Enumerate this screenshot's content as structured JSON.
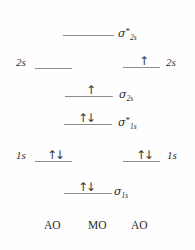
{
  "diagram": {
    "columns": [
      "AO",
      "MO",
      "AO"
    ],
    "footer": {
      "left": "AO",
      "center": "MO",
      "right": "AO"
    },
    "levels": [
      {
        "id": "sigma-star-2s",
        "column": "MO",
        "label": "σ*2s",
        "label_sigma": "σ",
        "label_star": "*",
        "label_sub": "2s",
        "electrons": "",
        "electron_count": 0
      },
      {
        "id": "ao-2s-left",
        "column": "AO-left",
        "label": "2s",
        "electrons": "",
        "electron_count": 0
      },
      {
        "id": "ao-2s-right",
        "column": "AO-right",
        "label": "2s",
        "electrons": "↑",
        "electron_count": 1
      },
      {
        "id": "sigma-2s",
        "column": "MO",
        "label": "σ2s",
        "label_sigma": "σ",
        "label_star": "",
        "label_sub": "2s",
        "electrons": "↑",
        "electron_count": 1
      },
      {
        "id": "sigma-star-1s",
        "column": "MO",
        "label": "σ*1s",
        "label_sigma": "σ",
        "label_star": "*",
        "label_sub": "1s",
        "electrons": "↑↓",
        "electron_count": 2
      },
      {
        "id": "ao-1s-left",
        "column": "AO-left",
        "label": "1s",
        "electrons": "↑↓",
        "electron_count": 2
      },
      {
        "id": "ao-1s-right",
        "column": "AO-right",
        "label": "1s",
        "electrons": "↑↓",
        "electron_count": 2
      },
      {
        "id": "sigma-1s",
        "column": "MO",
        "label": "σ1s",
        "label_sigma": "σ",
        "label_star": "",
        "label_sub": "1s",
        "electrons": "↑↓",
        "electron_count": 2
      }
    ],
    "colors": {
      "line": "#8d8d8d",
      "text": "#2b2b2b",
      "background": "#fffefe"
    }
  }
}
